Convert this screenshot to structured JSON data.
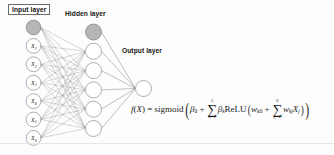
{
  "figure": {
    "width": 334,
    "height": 155,
    "background_color": "#fdfdfd"
  },
  "labels": {
    "input_layer": "Input layer",
    "hidden_layer": "Hidden layer",
    "output_layer": "Output layer"
  },
  "colors": {
    "bias_node_fill": "#b6b6b6",
    "neuron_fill": "#ffffff",
    "neuron_stroke": "#787878",
    "edge_stroke": "#7e7e7e",
    "text": "#141414"
  },
  "layers": {
    "input": {
      "name": "Input layer",
      "bias_node_label": "",
      "nodes": [
        {
          "var": "X",
          "sub": "1"
        },
        {
          "var": "X",
          "sub": "2"
        },
        {
          "var": "X",
          "sub": "3"
        },
        {
          "var": "X",
          "sub": "4"
        },
        {
          "var": "X",
          "sub": "5"
        },
        {
          "var": "X",
          "sub": "6"
        }
      ],
      "node_count": 6,
      "has_bias_node": true
    },
    "hidden": {
      "name": "Hidden layer",
      "node_count": 5,
      "has_bias_node": true,
      "activation": "ReLU"
    },
    "output": {
      "name": "Output layer",
      "node_count": 1,
      "has_bias_node": false,
      "activation": "sigmoid"
    }
  },
  "formula": {
    "lhs_function": "f",
    "lhs_arg": "X",
    "equals": "=",
    "outer_activation": "sigmoid",
    "outer_bias": "β",
    "outer_bias_sub": "0",
    "plus": "+",
    "outer_sum_symbol": "∑",
    "outer_sum_upper": "5",
    "outer_sum_lower": "k=1",
    "outer_coef": "β",
    "outer_coef_sub": "k",
    "inner_activation": "ReLU",
    "inner_bias": "w",
    "inner_bias_sub": "k0",
    "inner_sum_symbol": "∑",
    "inner_sum_upper": "6",
    "inner_sum_lower": "j=1",
    "inner_weight": "w",
    "inner_weight_sub": "kj",
    "inner_var": "X",
    "inner_var_sub": "j",
    "plain_text": "f(X) = sigmoid( β0 + Σ(k=1..5) βk ReLU( wk0 + Σ(j=1..6) wkj Xj ) )"
  }
}
